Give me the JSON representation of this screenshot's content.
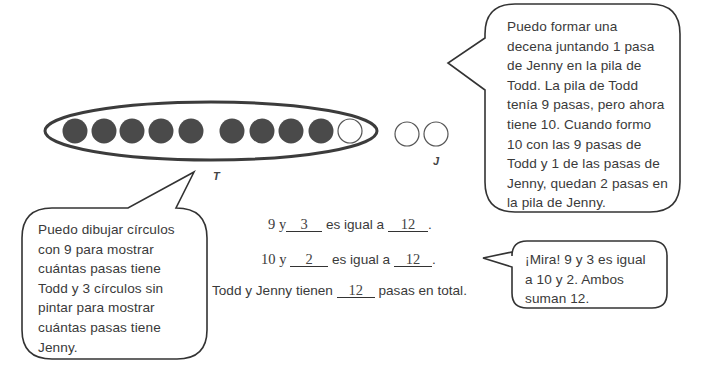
{
  "diagram": {
    "todd_pile": {
      "label": "T",
      "filled_count": 9,
      "open_count": 1,
      "fill_color": "#4a4a4a"
    },
    "jenny_pile": {
      "label": "J",
      "open_count": 2
    }
  },
  "bubbles": {
    "top_right": {
      "lines": [
        "Puedo formar una",
        "decena juntando 1 pasa",
        "de Jenny en la pila de",
        "Todd.  La pila de Todd",
        "tenía 9 pasas, pero ahora",
        "tiene 10.  Cuando formo",
        "10 con las 9 pasas de",
        "Todd y 1 de las pasas de",
        "Jenny, quedan 2 pasas en",
        "la pila de Jenny."
      ]
    },
    "bottom_left": {
      "lines": [
        "Puedo dibujar círculos",
        "con 9 para mostrar",
        "cuántas pasas tiene",
        "Todd y 3 círculos sin",
        "pintar para mostrar",
        "cuántas pasas tiene",
        "Jenny."
      ]
    },
    "bottom_right": {
      "lines": [
        "¡Mira!  9 y 3 es igual",
        "a 10 y 2.  Ambos",
        "suman 12."
      ]
    }
  },
  "equations": {
    "line1": {
      "prefix": "9 y",
      "blank1": "3",
      "middle": "es igual a",
      "blank2": "12",
      "suffix": "."
    },
    "line2": {
      "prefix": "10 y",
      "blank1": "2",
      "middle": "es igual a",
      "blank2": "12",
      "suffix": "."
    },
    "line3": {
      "prefix": "Todd y Jenny tienen",
      "blank1": "12",
      "suffix": "pasas en total."
    }
  }
}
